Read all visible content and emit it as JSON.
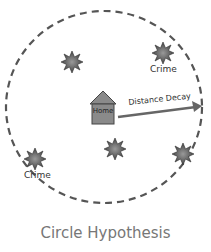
{
  "diagram": {
    "title": "Circle Hypothesis",
    "home_label": "Home",
    "arrow_label": "Distance Decay",
    "crime_labels": [
      "Crime",
      "Crime"
    ],
    "colors": {
      "circle": "#555555",
      "house_fill": "#8a8a8a",
      "house_stroke": "#444444",
      "arrow": "#666666",
      "crime_star": "#666666",
      "caption": "#777777"
    },
    "crimes": [
      {
        "x": 72,
        "y": 62,
        "label": ""
      },
      {
        "x": 163,
        "y": 53,
        "label": "Crime"
      },
      {
        "x": 35,
        "y": 159,
        "label": "Crime"
      },
      {
        "x": 115,
        "y": 149,
        "label": ""
      },
      {
        "x": 183,
        "y": 154,
        "label": ""
      }
    ]
  }
}
